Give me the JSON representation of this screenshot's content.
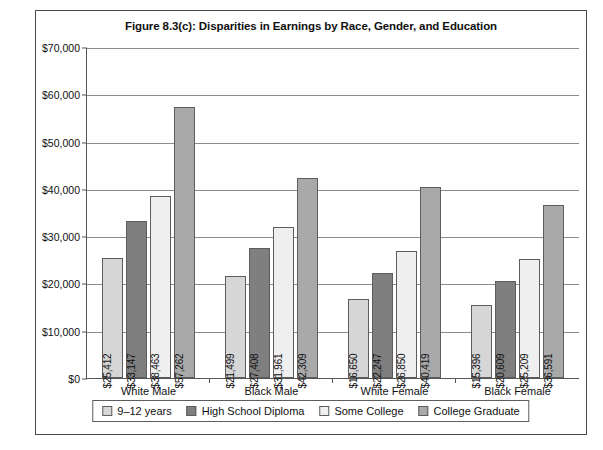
{
  "figure": {
    "title": "Figure 8.3(c): Disparities in Earnings by Race, Gender, and Education"
  },
  "chart_data": {
    "type": "bar",
    "title": "Figure 8.3(c): Disparities in Earnings by Race, Gender, and Education",
    "xlabel": "",
    "ylabel": "",
    "ylim": [
      0,
      70000
    ],
    "ytick_labels": [
      "$70,000",
      "$60,000",
      "$50,000",
      "$40,000",
      "$30,000",
      "$20,000",
      "$10,000",
      "$0"
    ],
    "ytick_values": [
      70000,
      60000,
      50000,
      40000,
      30000,
      20000,
      10000,
      0
    ],
    "grid": true,
    "legend_position": "bottom",
    "categories": [
      "White Male",
      "Black Male",
      "White Female",
      "Black Female"
    ],
    "series": [
      {
        "name": "9–12 years",
        "color": "#d6d6d6",
        "values": [
          25412,
          21499,
          16650,
          15396
        ],
        "labels": [
          "$25,412",
          "$21,499",
          "$16,650",
          "$15,396"
        ]
      },
      {
        "name": "High School Diploma",
        "color": "#7f7f7f",
        "values": [
          33147,
          27408,
          22247,
          20609
        ],
        "labels": [
          "$33,147",
          "$27,408",
          "$22,247",
          "$20,609"
        ]
      },
      {
        "name": "Some College",
        "color": "#efefef",
        "values": [
          38463,
          31961,
          26850,
          25209
        ],
        "labels": [
          "$38,463",
          "$31,961",
          "$26,850",
          "$25,209"
        ]
      },
      {
        "name": "College Graduate",
        "color": "#a9a9a9",
        "values": [
          57262,
          42309,
          40419,
          36591
        ],
        "labels": [
          "$57,262",
          "$42,309",
          "$40,419",
          "$36,591"
        ]
      }
    ]
  }
}
